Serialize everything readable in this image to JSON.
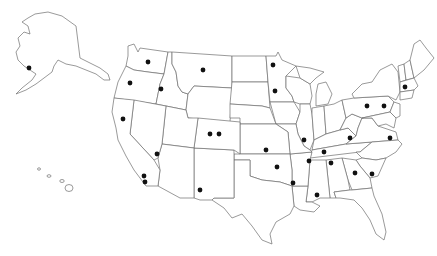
{
  "map": {
    "title": "",
    "type": "us-states-outline-with-point-markers",
    "colors": {
      "background": "#ffffff",
      "state_fill": "#ffffff",
      "state_stroke": "#6f6f6f",
      "marker": "#111111"
    },
    "marker_radius": 2.4,
    "markers": [
      {
        "label": "Alaska",
        "x": 29,
        "y": 68
      },
      {
        "label": "Washington",
        "x": 148,
        "y": 62
      },
      {
        "label": "Oregon",
        "x": 130,
        "y": 83
      },
      {
        "label": "Idaho",
        "x": 161,
        "y": 89
      },
      {
        "label": "Montana",
        "x": 203,
        "y": 70
      },
      {
        "label": "North Dakota / Minnesota border",
        "x": 273,
        "y": 65
      },
      {
        "label": "Minnesota",
        "x": 275,
        "y": 91
      },
      {
        "label": "Northern California",
        "x": 123,
        "y": 119
      },
      {
        "label": "Colorado 1",
        "x": 210,
        "y": 134
      },
      {
        "label": "Colorado 2",
        "x": 219,
        "y": 134
      },
      {
        "label": "Nevada / California border",
        "x": 157,
        "y": 154
      },
      {
        "label": "Southern California 1",
        "x": 144,
        "y": 176
      },
      {
        "label": "Southern California 2",
        "x": 145,
        "y": 182
      },
      {
        "label": "New Mexico",
        "x": 200,
        "y": 190
      },
      {
        "label": "Kansas",
        "x": 266,
        "y": 150
      },
      {
        "label": "Missouri",
        "x": 304,
        "y": 140
      },
      {
        "label": "Oklahoma",
        "x": 277,
        "y": 167
      },
      {
        "label": "Arkansas",
        "x": 309,
        "y": 161
      },
      {
        "label": "Tennessee west",
        "x": 324,
        "y": 152
      },
      {
        "label": "Tennessee",
        "x": 331,
        "y": 163
      },
      {
        "label": "Arkansas / Louisiana border",
        "x": 293,
        "y": 183
      },
      {
        "label": "Mississippi",
        "x": 317,
        "y": 195
      },
      {
        "label": "Kentucky",
        "x": 350,
        "y": 138
      },
      {
        "label": "Georgia",
        "x": 355,
        "y": 173
      },
      {
        "label": "South Carolina",
        "x": 372,
        "y": 174
      },
      {
        "label": "Virginia",
        "x": 390,
        "y": 138
      },
      {
        "label": "Pennsylvania 1",
        "x": 367,
        "y": 106
      },
      {
        "label": "Pennsylvania 2",
        "x": 384,
        "y": 106
      },
      {
        "label": "Massachusetts",
        "x": 405,
        "y": 87
      }
    ]
  }
}
